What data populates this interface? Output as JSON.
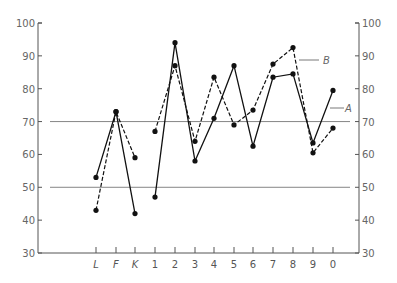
{
  "chart_data": {
    "type": "line",
    "title": "",
    "xlabel": "",
    "ylabel": "",
    "ylim": [
      30,
      100
    ],
    "yticks": [
      30,
      40,
      50,
      60,
      70,
      80,
      90,
      100
    ],
    "right_axis_ticks": [
      30,
      40,
      50,
      60,
      70,
      80,
      90,
      100
    ],
    "reference_lines": [
      70,
      50
    ],
    "grid": false,
    "legend": "inline labels",
    "categories": [
      "L",
      "F",
      "K",
      "1",
      "2",
      "3",
      "4",
      "5",
      "6",
      "7",
      "8",
      "9",
      "0"
    ],
    "series_groups": [
      {
        "range": [
          0,
          2
        ],
        "note": "L-F-K segment"
      },
      {
        "range": [
          3,
          12
        ],
        "note": "1-0 segment"
      }
    ],
    "series": [
      {
        "name": "A",
        "style": "solid",
        "values": [
          53,
          73,
          42,
          47,
          94,
          58,
          71,
          87,
          62.5,
          83.5,
          84.5,
          63.5,
          79.5
        ]
      },
      {
        "name": "B",
        "style": "dashed",
        "values": [
          43,
          73,
          59,
          67,
          87,
          64,
          83.5,
          69,
          73.5,
          87.5,
          92.5,
          60.5,
          68
        ]
      }
    ],
    "annotations": [
      {
        "text": "A",
        "target_series": "A",
        "near_category": "0"
      },
      {
        "text": "B",
        "target_series": "B",
        "near_category": "8"
      }
    ]
  },
  "labels": {
    "series_a": "A",
    "series_b": "B"
  }
}
